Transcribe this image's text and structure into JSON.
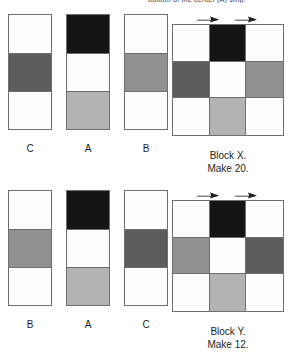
{
  "header": {
    "clipped_text": "bottom of the center (A) strip."
  },
  "colors": {
    "white": "#fdfdfd",
    "light_gray": "#b3b3b3",
    "medium_gray": "#909090",
    "dark_gray": "#5c5c5c",
    "black": "#141414",
    "outline": "#6f6f6f",
    "text": "#231f20"
  },
  "sections": [
    {
      "id": "block-x",
      "strips": [
        {
          "label": "C",
          "cells": [
            "white",
            "dark_gray",
            "white"
          ]
        },
        {
          "label": "A",
          "cells": [
            "black",
            "white",
            "light_gray"
          ]
        },
        {
          "label": "B",
          "cells": [
            "white",
            "medium_gray",
            "white"
          ]
        }
      ],
      "block": {
        "arrows": [
          "arrow-right-marker",
          "arrow-right-marker"
        ],
        "grid": [
          [
            "white",
            "black",
            "white"
          ],
          [
            "dark_gray",
            "white",
            "medium_gray"
          ],
          [
            "white",
            "light_gray",
            "white"
          ]
        ],
        "caption_line1": "Block X.",
        "caption_line2": "Make 20."
      }
    },
    {
      "id": "block-y",
      "strips": [
        {
          "label": "B",
          "cells": [
            "white",
            "medium_gray",
            "white"
          ]
        },
        {
          "label": "A",
          "cells": [
            "black",
            "white",
            "light_gray"
          ]
        },
        {
          "label": "C",
          "cells": [
            "white",
            "dark_gray",
            "white"
          ]
        }
      ],
      "block": {
        "arrows": [
          "arrow-right-marker",
          "arrow-right-marker"
        ],
        "grid": [
          [
            "white",
            "black",
            "white"
          ],
          [
            "medium_gray",
            "white",
            "dark_gray"
          ],
          [
            "white",
            "light_gray",
            "white"
          ]
        ],
        "caption_line1": "Block Y.",
        "caption_line2": "Make 12."
      }
    }
  ]
}
